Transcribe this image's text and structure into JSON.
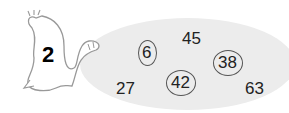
{
  "exercise": {
    "number": "2",
    "numbers": [
      {
        "value": "6",
        "circled": true
      },
      {
        "value": "45",
        "circled": false
      },
      {
        "value": "38",
        "circled": true
      },
      {
        "value": "27",
        "circled": false
      },
      {
        "value": "42",
        "circled": true
      },
      {
        "value": "63",
        "circled": false
      }
    ]
  }
}
